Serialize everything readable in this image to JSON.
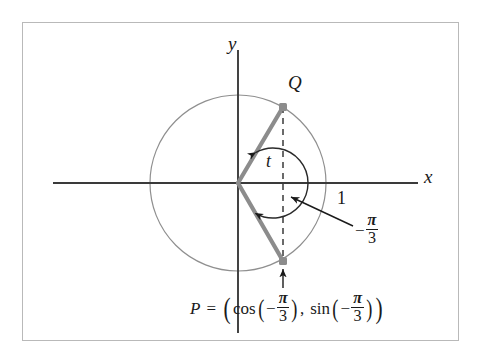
{
  "figure": {
    "border_color": "#b9b9b9",
    "background": "#ffffff"
  },
  "axes": {
    "x_label": "x",
    "y_label": "y",
    "axis_color": "#3a3a3a",
    "x_axis": {
      "from_x": -2.1,
      "to_x": 2.05,
      "y": 0
    },
    "y_axis": {
      "x": 0,
      "from_y": -1.75,
      "to_y": 1.65
    }
  },
  "circle": {
    "center": [
      0,
      0
    ],
    "radius": 1,
    "stroke": "#7a7a7a",
    "fill": "none"
  },
  "ticks": [
    {
      "label": "1",
      "x": 1,
      "y": 0,
      "position": "below-right"
    }
  ],
  "points": [
    {
      "name": "Q",
      "label": "Q",
      "angle_radians": "pi/3",
      "coords": [
        0.515,
        0.857
      ],
      "marker": "square",
      "marker_color": "#8c8c8c"
    },
    {
      "name": "P",
      "label": "P",
      "angle_radians": "-pi/3",
      "coords": [
        0.515,
        -0.887
      ],
      "marker": "square",
      "marker_color": "#8c8c8c"
    }
  ],
  "radii": [
    {
      "from": "O",
      "to": "Q",
      "stroke": "#8c8c8c",
      "width": 4
    },
    {
      "from": "O",
      "to": "P",
      "stroke": "#8c8c8c",
      "width": 4
    }
  ],
  "dashed_segments": [
    {
      "from": "Q",
      "to": "P",
      "stroke": "#6a6a6a",
      "dash": "6,5"
    }
  ],
  "angle_arc": {
    "label": "t",
    "from_angle_deg": 60,
    "to_angle_deg": -60,
    "double_headed": true,
    "stroke": "#2a2a2a"
  },
  "annotations": {
    "angle_value": {
      "sign": "−",
      "numerator": "π",
      "denominator": "3",
      "full_text": "−π/3",
      "arrow_to": "angle-arc"
    },
    "point_p_equation": {
      "lhs": "P",
      "equals": "=",
      "open_paren": "(",
      "cos_name": "cos",
      "cos_open": "(",
      "cos_sign": "−",
      "cos_numerator": "π",
      "cos_denominator": "3",
      "cos_close": ")",
      "comma": ",",
      "sin_name": "sin",
      "sin_open": "(",
      "sin_sign": "−",
      "sin_numerator": "π",
      "sin_denominator": "3",
      "sin_close": ")",
      "close_paren": ")",
      "full_text": "P = (cos(−π/3), sin(−π/3))",
      "arrow_to": "point-P"
    }
  },
  "colors": {
    "ink": "#1a1a1a",
    "axis": "#3a3a3a",
    "circle": "#7a7a7a",
    "radius_gray": "#8c8c8c",
    "dashed": "#6a6a6a",
    "frame": "#b9b9b9"
  }
}
